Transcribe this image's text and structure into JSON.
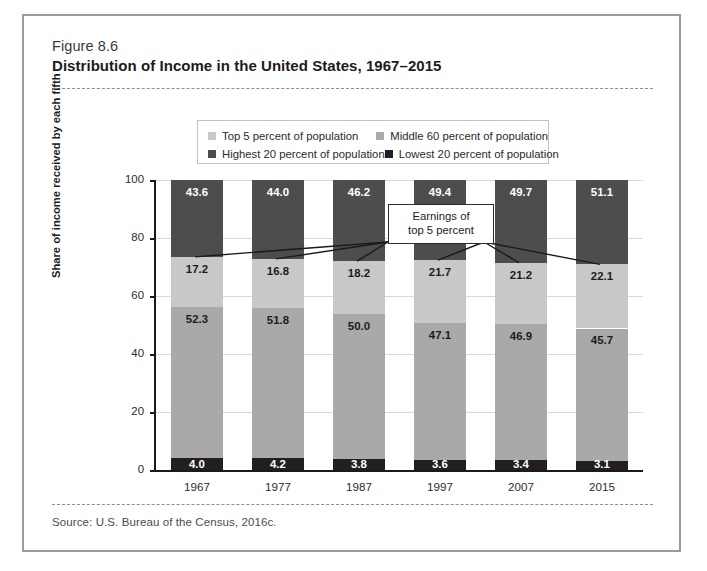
{
  "figure": {
    "number": "Figure 8.6",
    "title": "Distribution of Income in the United States, 1967–2015",
    "source": "Source: U.S. Bureau of the Census, 2016c."
  },
  "colors": {
    "top5": "#c8c8c8",
    "middle60": "#a9a9a9",
    "highest20": "#4d4d4d",
    "lowest20": "#231f20",
    "frame": "#9a9a9a",
    "axis": "#1a1a1a",
    "grid": "#d9d9d9",
    "background": "#ffffff"
  },
  "legend": {
    "items": [
      {
        "label": "Top 5 percent of population",
        "color_key": "top5"
      },
      {
        "label": "Middle 60 percent of population",
        "color_key": "middle60"
      },
      {
        "label": "Highest 20 percent of population",
        "color_key": "highest20"
      },
      {
        "label": "Lowest 20 percent of population",
        "color_key": "lowest20"
      }
    ]
  },
  "annotation": {
    "line1": "Earnings of",
    "line2": "top 5 percent"
  },
  "chart_data": {
    "type": "bar",
    "title": "Distribution of Income in the United States, 1967–2015",
    "xlabel": "",
    "ylabel": "Share of income received by each fifth",
    "ylim": [
      0,
      100
    ],
    "yticks": [
      0,
      20,
      40,
      60,
      80,
      100
    ],
    "ytick_labels": [
      "0",
      "20",
      "40",
      "60",
      "80",
      "100"
    ],
    "grid": true,
    "legend_position": "above-plot",
    "stacked": true,
    "categories": [
      "1967",
      "1977",
      "1987",
      "1997",
      "2007",
      "2015"
    ],
    "series": [
      {
        "name": "Lowest 20 percent of population",
        "color_key": "lowest20",
        "values": [
          4.0,
          4.2,
          3.8,
          3.6,
          3.4,
          3.1
        ],
        "labels": [
          "4.0",
          "4.2",
          "3.8",
          "3.6",
          "3.4",
          "3.1"
        ]
      },
      {
        "name": "Middle 60 percent of population",
        "color_key": "middle60",
        "values": [
          52.3,
          51.8,
          50.0,
          47.1,
          46.9,
          45.7
        ],
        "labels": [
          "52.3",
          "51.8",
          "50.0",
          "47.1",
          "46.9",
          "45.7"
        ]
      },
      {
        "name": "Highest 20 percent of population",
        "color_key": "highest20",
        "values": [
          43.6,
          44.0,
          46.2,
          49.4,
          49.7,
          51.1
        ],
        "labels": [
          "43.6",
          "44.0",
          "46.2",
          "49.4",
          "49.7",
          "51.1"
        ]
      },
      {
        "name": "Top 5 percent of population",
        "color_key": "top5",
        "values": [
          17.2,
          16.8,
          18.2,
          21.7,
          21.2,
          22.1
        ],
        "labels": [
          "17.2",
          "16.8",
          "18.2",
          "21.7",
          "21.2",
          "22.1"
        ],
        "note": "overlay subset drawn inside the lower part of the Highest 20 percent band"
      }
    ]
  }
}
